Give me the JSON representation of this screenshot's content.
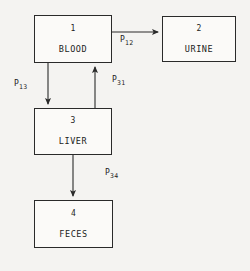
{
  "diagram": {
    "background_color": "#f4f3f1",
    "line_color": "#2a2a2a",
    "nodes": [
      {
        "id": "1",
        "label": "BLOOD",
        "x": 34,
        "y": 15,
        "width": 78,
        "height": 48
      },
      {
        "id": "2",
        "label": "URINE",
        "x": 162,
        "y": 16,
        "width": 74,
        "height": 46
      },
      {
        "id": "3",
        "label": "LIVER",
        "x": 34,
        "y": 108,
        "width": 78,
        "height": 47
      },
      {
        "id": "4",
        "label": "FECES",
        "x": 34,
        "y": 200,
        "width": 79,
        "height": 48
      }
    ],
    "edges": [
      {
        "name": "blood-to-urine",
        "symbol": "P",
        "sub": "12",
        "from": "1",
        "to": "2",
        "direction": "right"
      },
      {
        "name": "blood-to-liver",
        "symbol": "P",
        "sub": "13",
        "from": "1",
        "to": "3",
        "direction": "down"
      },
      {
        "name": "liver-to-blood",
        "symbol": "P",
        "sub": "31",
        "from": "3",
        "to": "1",
        "direction": "up"
      },
      {
        "name": "liver-to-feces",
        "symbol": "P",
        "sub": "34",
        "from": "3",
        "to": "4",
        "direction": "down"
      }
    ]
  }
}
